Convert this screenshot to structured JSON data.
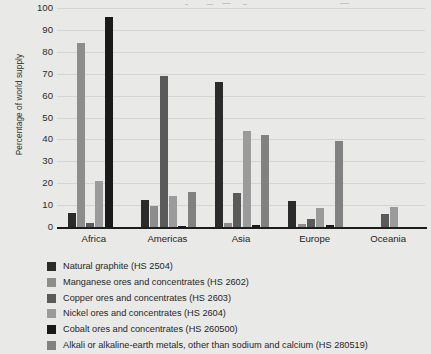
{
  "chart_data": {
    "type": "bar",
    "title": "",
    "subtitle": "",
    "xlabel": "",
    "ylabel": "Percentage of world supply",
    "ylim": [
      0,
      100
    ],
    "yticks": [
      0,
      10,
      20,
      30,
      40,
      50,
      60,
      70,
      80,
      90,
      100
    ],
    "ytick_labels": [
      "0",
      "10",
      "20",
      "30",
      "40",
      "50",
      "60",
      "70",
      "80",
      "90",
      "100"
    ],
    "grid": true,
    "legend_position": "below",
    "categories": [
      "Africa",
      "Americas",
      "Asia",
      "Europe",
      "Oceania"
    ],
    "series": [
      {
        "name": "Natural graphite (HS 2504)",
        "color": "#2b2b2b",
        "values": [
          6.5,
          12.5,
          66,
          12,
          0
        ]
      },
      {
        "name": "Manganese ores and concentrates (HS 2602)",
        "color": "#8d8d8d",
        "values": [
          84,
          9.5,
          2,
          1.5,
          0
        ]
      },
      {
        "name": "Copper ores and concentrates (HS 2603)",
        "color": "#5a5a5a",
        "values": [
          2,
          69,
          15.5,
          3.5,
          6
        ]
      },
      {
        "name": "Nickel ores and concentrates (HS 2604)",
        "color": "#9b9b9b",
        "values": [
          21,
          14,
          44,
          8.5,
          9
        ]
      },
      {
        "name": "Cobalt ores and concentrates (HS 260500)",
        "color": "#1a1a1a",
        "values": [
          96,
          0.5,
          1,
          1,
          0
        ]
      },
      {
        "name": "Alkali or alkaline-earth metals, other than sodium and calcium (HS 280519)",
        "color": "#818181",
        "values": [
          0,
          16,
          42,
          39.5,
          0
        ]
      }
    ]
  },
  "colors": {
    "background": "#e9e9e7",
    "axis": "#1d1d1d",
    "text": "#262626",
    "gridline": "#aaaaa5"
  }
}
